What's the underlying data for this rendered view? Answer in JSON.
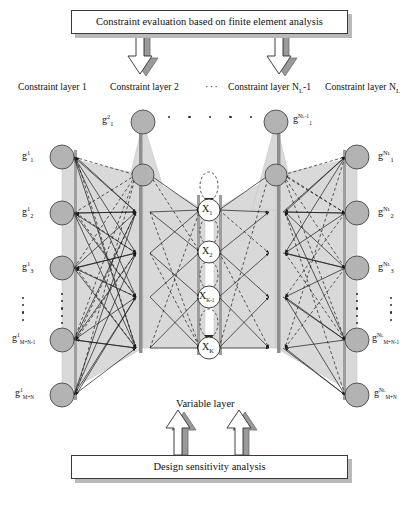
{
  "diagram": {
    "title_top": "Constraint evaluation based on finite element analysis",
    "title_bottom": "Design sensitivity analysis",
    "variable_layer_label": "Variable layer",
    "layer_captions": [
      {
        "text": "Constraint layer 1",
        "x": 18,
        "id": "constraint-layer-1"
      },
      {
        "text": "Constraint layer 2",
        "x": 110,
        "id": "constraint-layer-2"
      },
      {
        "text": "···",
        "x": 205,
        "id": "layer-ellipsis"
      },
      {
        "text": "Constraint layer N",
        "x": 228,
        "sub": "L",
        "suffix": "-1",
        "id": "constraint-layer-nl-minus-1"
      },
      {
        "text": "Constraint layer N",
        "x": 325,
        "sub": "L",
        "suffix": "",
        "id": "constraint-layer-nl"
      }
    ],
    "left_layer": {
      "name": "constraint-layer-1",
      "node_x": 62,
      "nodes": [
        {
          "base": "g",
          "sub": "1",
          "sup": "1",
          "y": 157
        },
        {
          "base": "g",
          "sub": "2",
          "sup": "1",
          "y": 213
        },
        {
          "base": "g",
          "sub": "3",
          "sup": "1",
          "y": 268
        },
        {
          "base": "g",
          "sub": "M+N-1",
          "sup": "1",
          "y": 340
        },
        {
          "base": "g",
          "sub": "M+N",
          "sup": "1",
          "y": 395
        }
      ]
    },
    "right_layer": {
      "name": "constraint-layer-nl",
      "node_x": 357,
      "nodes": [
        {
          "base": "g",
          "sub": "1",
          "sup": "N_L",
          "y": 157
        },
        {
          "base": "g",
          "sub": "2",
          "sup": "N_L",
          "y": 213
        },
        {
          "base": "g",
          "sub": "3",
          "sup": "N_L",
          "y": 268
        },
        {
          "base": "g",
          "sub": "M+N-1",
          "sup": "N_L",
          "y": 340
        },
        {
          "base": "g",
          "sub": "M+N",
          "sup": "N_L",
          "y": 395
        }
      ]
    },
    "inner_left_layer": {
      "name": "constraint-layer-2",
      "node_x": 143,
      "top_label": {
        "base": "g",
        "sub": "1",
        "sup": "2"
      },
      "node_ys": [
        122,
        175,
        212,
        253,
        297,
        348
      ]
    },
    "inner_right_layer": {
      "name": "constraint-layer-nl-minus-1",
      "node_x": 276,
      "top_label": {
        "base": "g",
        "sub": "1",
        "sup": "N_L-1"
      },
      "node_ys": [
        122,
        175,
        212,
        253,
        297,
        348
      ]
    },
    "variable_layer": {
      "name": "variable-layer",
      "node_x": 209,
      "nodes": [
        {
          "label": "X",
          "sub": "1",
          "y": 210
        },
        {
          "label": "X",
          "sub": "2",
          "y": 252
        },
        {
          "label": "X",
          "sub": "K-1",
          "y": 297
        },
        {
          "label": "X",
          "sub": "K",
          "y": 348
        }
      ]
    },
    "colors": {
      "node_fill": "#b3b3b3",
      "node_stroke": "#4a4a4a",
      "fan_fill": "#d9d9d9",
      "line": "#1a1a1a",
      "box_shadow": "#b9b9b9",
      "box_border": "#3a3a3a"
    }
  }
}
